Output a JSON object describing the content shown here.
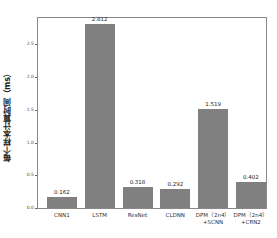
{
  "chart_data": {
    "type": "bar",
    "title": "",
    "xlabel": "",
    "ylabel": "每个样本计算时间（ms）",
    "categories": [
      "CNN1",
      "LSTM",
      "ResNet",
      "CLDNN",
      "DPM（2n4）+SCNN",
      "DPM（2n4）+CRN2"
    ],
    "category_lines": [
      [
        "CNN1"
      ],
      [
        "LSTM"
      ],
      [
        "ResNet"
      ],
      [
        "CLDNN"
      ],
      [
        "DPM（2n4）",
        "+SCNN"
      ],
      [
        "DPM（2n4）",
        "+CRN2"
      ]
    ],
    "values": [
      0.162,
      2.812,
      0.318,
      0.292,
      1.519,
      0.402
    ],
    "value_labels": [
      "0.162",
      "2.812",
      "0.318",
      "0.292",
      "1.519",
      "0.402"
    ],
    "yticks": [
      "0.0",
      "0.5",
      "1.0",
      "1.5",
      "2.0",
      "2.5"
    ],
    "ylim": [
      0,
      2.9
    ],
    "grid": false,
    "bar_color": "#808080"
  }
}
